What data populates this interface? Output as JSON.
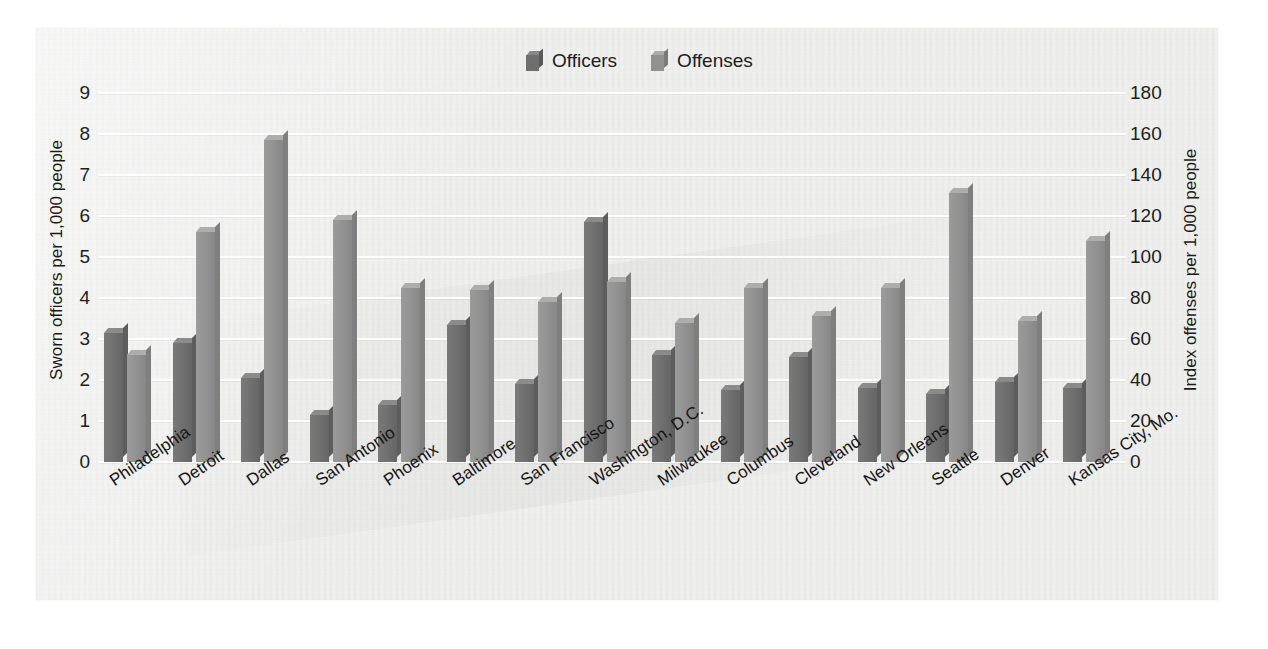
{
  "chart_data": {
    "type": "bar",
    "title": "",
    "subtitle": "",
    "grid": true,
    "legend_position": "top-center",
    "categories": [
      "Philadelphia",
      "Detroit",
      "Dallas",
      "San Antonio",
      "Phoenix",
      "Baltimore",
      "San Francisco",
      "Washington, D.C.",
      "Milwaukee",
      "Columbus",
      "Cleveland",
      "New Orleans",
      "Seattle",
      "Denver",
      "Kansas City, Mo."
    ],
    "series": [
      {
        "name": "Officers",
        "axis": "left",
        "color": "#6f6f6f",
        "values": [
          3.15,
          2.9,
          2.05,
          1.15,
          1.4,
          3.35,
          1.9,
          5.85,
          2.6,
          1.75,
          2.55,
          1.8,
          1.65,
          1.95,
          1.8
        ]
      },
      {
        "name": "Offenses",
        "axis": "right",
        "color": "#919191",
        "values": [
          52,
          112,
          157,
          118,
          85,
          84,
          78,
          88,
          68,
          85,
          71,
          85,
          131,
          69,
          108
        ]
      }
    ],
    "xlabel": "",
    "ylabel_left": "Sworn officers per 1,000 people",
    "ylabel_right": "Index offenses per 1,000 people",
    "ylim_left": [
      0,
      9
    ],
    "ylim_right": [
      0,
      180
    ],
    "yticks_left": [
      "0",
      "1",
      "2",
      "3",
      "4",
      "5",
      "6",
      "7",
      "8",
      "9"
    ],
    "yticks_right": [
      "0",
      "20",
      "40",
      "60",
      "80",
      "100",
      "120",
      "140",
      "160",
      "180"
    ]
  },
  "legend": {
    "items": [
      {
        "label": "Officers",
        "swatch": "cube-icon-dark"
      },
      {
        "label": "Offenses",
        "swatch": "cube-icon-light"
      }
    ]
  },
  "colors": {
    "panel_background": "#f2f2f1",
    "gridline": "#fdfdfd",
    "officers_bar": "#6f6f6f",
    "offenses_bar": "#919191",
    "text": "#1b1b1b"
  }
}
